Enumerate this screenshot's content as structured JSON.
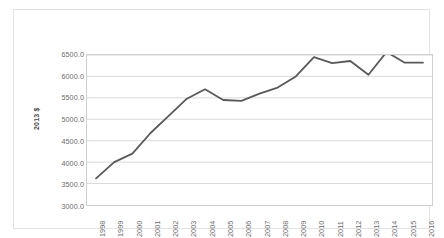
{
  "chart_data": {
    "type": "line",
    "title": "",
    "subtitle": "",
    "xlabel": "",
    "ylabel": "2013 $",
    "x": [
      "1998",
      "1999",
      "2000",
      "2001",
      "2002",
      "2003",
      "2004",
      "2005",
      "2006",
      "2007",
      "2008",
      "2009",
      "2010",
      "2011",
      "2012",
      "2013",
      "2014",
      "2015",
      "2016"
    ],
    "categories": [
      "1998",
      "1999",
      "2000",
      "2001",
      "2002",
      "2003",
      "2004",
      "2005",
      "2006",
      "2007",
      "2008",
      "2009",
      "2010",
      "2011",
      "2012",
      "2013",
      "2014",
      "2015",
      "2016"
    ],
    "values": [
      3620,
      4000,
      4200,
      4680,
      5080,
      5480,
      5700,
      5450,
      5430,
      5600,
      5740,
      6000,
      6450,
      6310,
      6360,
      6040,
      6570,
      6320,
      6320
    ],
    "series": [
      {
        "name": "2013 $",
        "values": [
          3620,
          4000,
          4200,
          4680,
          5080,
          5480,
          5700,
          5450,
          5430,
          5600,
          5740,
          6000,
          6450,
          6310,
          6360,
          6040,
          6570,
          6320,
          6320
        ],
        "color": "#595959"
      }
    ],
    "ylim": [
      3000,
      6500
    ],
    "ytick_step": 500,
    "ytick_labels": [
      "6500.0",
      "6000.0",
      "5500.0",
      "5000.0",
      "4500.0",
      "4000.0",
      "3500.0",
      "3000.0"
    ],
    "ytick_values": [
      6500,
      6000,
      5500,
      5000,
      4500,
      4000,
      3500,
      3000
    ],
    "grid": "horizontal",
    "grid_color": "#d9d9d9",
    "legend": "none",
    "legend_position": "none",
    "markers": "none",
    "line_width": 1.8,
    "plot_border_color": "#d0d0d0",
    "frame_border_color": "#e3e3e3",
    "background_color": "#ffffff",
    "xtick_rotation": -90,
    "annotations": []
  }
}
